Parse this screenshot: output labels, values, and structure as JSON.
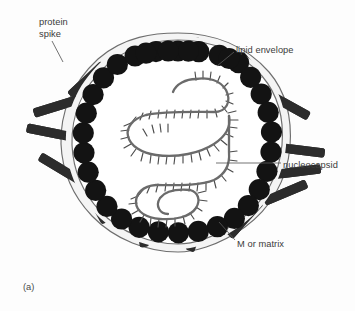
{
  "figure": {
    "caption": "(a)",
    "background_color": "#fdfdfd",
    "text_color": "#3b3b3b"
  },
  "labels": {
    "protein_spike": "protein\nspike",
    "lipid_envelope": "lipid envelope",
    "nucleocapsid": "nucleocapsid",
    "m_or_matrix": "M or matrix"
  },
  "diagram_data": {
    "type": "diagram",
    "title": "Enveloped virus structure",
    "colors": {
      "matrix_protein": "#131313",
      "spike": "#2c2c2c",
      "envelope_line": "#6e6e6e",
      "envelope_fill": "#f2f2f2",
      "nucleocapsid": "#6b6b6b",
      "leader_line": "#5a5a5a"
    },
    "components": [
      {
        "name": "protein spike",
        "count": 16,
        "shape": "rounded bar",
        "position": "radiating outward through lipid envelope"
      },
      {
        "name": "lipid envelope",
        "count": 1,
        "shape": "irregular closed double line",
        "position": "outer boundary of virion"
      },
      {
        "name": "M or matrix",
        "count": 34,
        "shape": "filled circle",
        "position": "ring lining the inner face of the envelope"
      },
      {
        "name": "nucleocapsid",
        "count": 1,
        "shape": "serpentine helical ribbon with radiating subunit ticks",
        "position": "coiled within the virion interior"
      }
    ],
    "envelope_outline_points": [
      [
        178,
        36
      ],
      [
        213,
        41
      ],
      [
        243,
        53
      ],
      [
        266,
        74
      ],
      [
        280,
        103
      ],
      [
        284,
        136
      ],
      [
        279,
        170
      ],
      [
        265,
        199
      ],
      [
        243,
        224
      ],
      [
        212,
        240
      ],
      [
        178,
        246
      ],
      [
        144,
        242
      ],
      [
        114,
        228
      ],
      [
        90,
        207
      ],
      [
        75,
        180
      ],
      [
        69,
        148
      ],
      [
        71,
        115
      ],
      [
        84,
        85
      ],
      [
        105,
        60
      ],
      [
        139,
        42
      ]
    ]
  }
}
